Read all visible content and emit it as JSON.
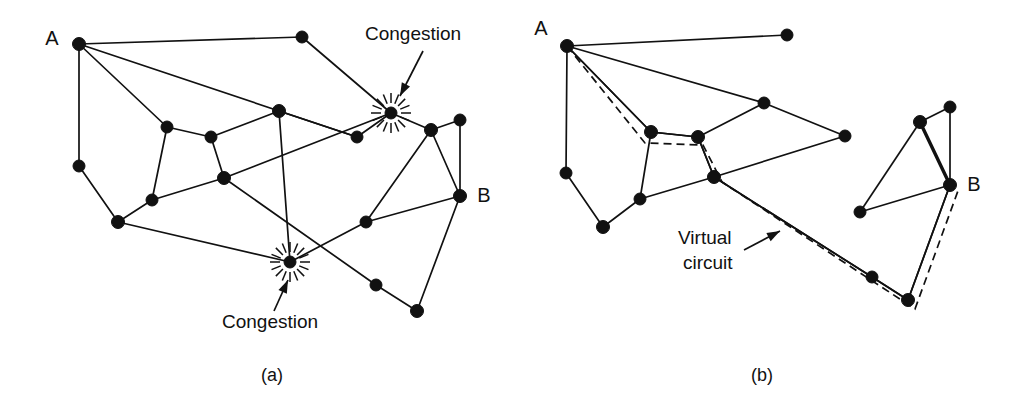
{
  "figure": {
    "background": "#ffffff",
    "ink": "#111111",
    "width": 1019,
    "height": 413
  },
  "panels": [
    {
      "id": "panel-a",
      "caption": "(a)",
      "caption_pos": {
        "x": 272,
        "y": 376
      },
      "nodes": [
        {
          "id": "a_A",
          "x": 79,
          "y": 44,
          "r": 6.5
        },
        {
          "id": "a_n1",
          "x": 302,
          "y": 37,
          "r": 6.0
        },
        {
          "id": "a_n2",
          "x": 167,
          "y": 127,
          "r": 6.0
        },
        {
          "id": "a_n3",
          "x": 211,
          "y": 137,
          "r": 6.0
        },
        {
          "id": "a_n4",
          "x": 279,
          "y": 111,
          "r": 6.5
        },
        {
          "id": "a_n5",
          "x": 357,
          "y": 137,
          "r": 6.0
        },
        {
          "id": "a_n6",
          "x": 431,
          "y": 130,
          "r": 6.5
        },
        {
          "id": "a_n7",
          "x": 460,
          "y": 120,
          "r": 6.0
        },
        {
          "id": "a_B",
          "x": 460,
          "y": 196,
          "r": 6.5
        },
        {
          "id": "a_n8",
          "x": 224,
          "y": 178,
          "r": 6.5
        },
        {
          "id": "a_n9",
          "x": 152,
          "y": 200,
          "r": 6.0
        },
        {
          "id": "a_n10",
          "x": 79,
          "y": 166,
          "r": 6.0
        },
        {
          "id": "a_n11",
          "x": 118,
          "y": 222,
          "r": 6.5
        },
        {
          "id": "a_n12",
          "x": 366,
          "y": 222,
          "r": 6.0
        },
        {
          "id": "a_n13",
          "x": 376,
          "y": 285,
          "r": 6.0
        },
        {
          "id": "a_n14",
          "x": 417,
          "y": 311,
          "r": 6.5
        }
      ],
      "congestion_nodes": [
        {
          "id": "a_c1",
          "x": 391,
          "y": 113,
          "r": 6.0,
          "burst_inner": 10,
          "burst_outer": 20,
          "rays": 16
        },
        {
          "id": "a_c2",
          "x": 290,
          "y": 262,
          "r": 6.0,
          "burst_inner": 10,
          "burst_outer": 20,
          "rays": 16
        }
      ],
      "edges": [
        [
          "a_A",
          "a_n1"
        ],
        [
          "a_A",
          "a_n10"
        ],
        [
          "a_A",
          "a_n2"
        ],
        [
          "a_A",
          "a_n5"
        ],
        [
          "a_n1",
          "a_c1"
        ],
        [
          "a_n2",
          "a_n3"
        ],
        [
          "a_n2",
          "a_n9"
        ],
        [
          "a_n3",
          "a_n4"
        ],
        [
          "a_n3",
          "a_n8"
        ],
        [
          "a_n4",
          "a_n5"
        ],
        [
          "a_n4",
          "a_c2"
        ],
        [
          "a_n5",
          "a_c1"
        ],
        [
          "a_c1",
          "a_n6"
        ],
        [
          "a_n6",
          "a_n7"
        ],
        [
          "a_n6",
          "a_B"
        ],
        [
          "a_n6",
          "a_n12"
        ],
        [
          "a_n7",
          "a_B"
        ],
        [
          "a_B",
          "a_n12"
        ],
        [
          "a_B",
          "a_n14"
        ],
        [
          "a_n8",
          "a_n9"
        ],
        [
          "a_n8",
          "a_n13"
        ],
        [
          "a_n8",
          "a_c1"
        ],
        [
          "a_n9",
          "a_n11"
        ],
        [
          "a_n10",
          "a_n11"
        ],
        [
          "a_n11",
          "a_c2"
        ],
        [
          "a_n12",
          "a_c2"
        ],
        [
          "a_n13",
          "a_n14"
        ]
      ],
      "node_labels": [
        {
          "text": "A",
          "x": 52,
          "y": 40,
          "anchor": "middle"
        },
        {
          "text": "B",
          "x": 484,
          "y": 197,
          "anchor": "middle"
        }
      ],
      "annotations": [
        {
          "id": "congestion-top",
          "text": "Congestion",
          "text_x": 365,
          "text_y": 35,
          "anchor": "start",
          "leader": {
            "x1": 423,
            "y1": 51,
            "x2": 400,
            "y2": 96
          }
        },
        {
          "id": "congestion-bottom",
          "text": "Congestion",
          "text_x": 222,
          "text_y": 323,
          "anchor": "start",
          "leader": {
            "x1": 274,
            "y1": 311,
            "x2": 288,
            "y2": 280
          }
        }
      ]
    },
    {
      "id": "panel-b",
      "caption": "(b)",
      "caption_pos": {
        "x": 762,
        "y": 376
      },
      "nodes": [
        {
          "id": "b_A",
          "x": 567,
          "y": 46,
          "r": 6.5
        },
        {
          "id": "b_n1",
          "x": 787,
          "y": 35,
          "r": 6.0
        },
        {
          "id": "b_n2",
          "x": 651,
          "y": 132,
          "r": 6.5
        },
        {
          "id": "b_n3",
          "x": 698,
          "y": 137,
          "r": 6.5
        },
        {
          "id": "b_n4",
          "x": 764,
          "y": 103,
          "r": 6.0
        },
        {
          "id": "b_n5",
          "x": 845,
          "y": 136,
          "r": 6.0
        },
        {
          "id": "b_n6",
          "x": 714,
          "y": 177,
          "r": 6.5
        },
        {
          "id": "b_n7",
          "x": 640,
          "y": 199,
          "r": 6.0
        },
        {
          "id": "b_n8",
          "x": 566,
          "y": 173,
          "r": 6.0
        },
        {
          "id": "b_n9",
          "x": 603,
          "y": 227,
          "r": 6.5
        },
        {
          "id": "b_n10",
          "x": 920,
          "y": 122,
          "r": 6.5
        },
        {
          "id": "b_n11",
          "x": 950,
          "y": 107,
          "r": 6.0
        },
        {
          "id": "b_B",
          "x": 950,
          "y": 185,
          "r": 6.5
        },
        {
          "id": "b_n12",
          "x": 860,
          "y": 212,
          "r": 6.0
        },
        {
          "id": "b_n13",
          "x": 872,
          "y": 277,
          "r": 6.0
        },
        {
          "id": "b_n14",
          "x": 908,
          "y": 300,
          "r": 6.5
        }
      ],
      "edges": [
        [
          "b_A",
          "b_n1"
        ],
        [
          "b_A",
          "b_n8"
        ],
        [
          "b_A",
          "b_n2"
        ],
        [
          "b_A",
          "b_n4"
        ],
        [
          "b_n2",
          "b_n3"
        ],
        [
          "b_n2",
          "b_n7"
        ],
        [
          "b_n3",
          "b_n4"
        ],
        [
          "b_n3",
          "b_n6"
        ],
        [
          "b_n4",
          "b_n5"
        ],
        [
          "b_n5",
          "b_n6"
        ],
        [
          "b_n6",
          "b_n7"
        ],
        [
          "b_n7",
          "b_n9"
        ],
        [
          "b_n8",
          "b_n9"
        ],
        [
          "b_n10",
          "b_n11"
        ],
        [
          "b_n10",
          "b_n12"
        ],
        [
          "b_n11",
          "b_B"
        ],
        [
          "b_n12",
          "b_B"
        ],
        [
          "b_n13",
          "b_n14"
        ],
        [
          "b_n14",
          "b_B"
        ],
        [
          "b_n6",
          "b_n13"
        ]
      ],
      "thick_edges": [
        [
          "b_n10",
          "b_B"
        ]
      ],
      "virtual_circuit": {
        "label_lines": [
          "Virtual",
          "circuit"
        ],
        "label_x": 678,
        "label_y1": 239,
        "label_y2": 264,
        "leader": {
          "x1": 744,
          "y1": 250,
          "x2": 780,
          "y2": 231
        },
        "solid_path": "M 567,46 L 651,132 L 698,137 L 714,177 L 872,277 L 908,300 L 950,185",
        "dashed_path": "M 567,46 L 645,143 L 703,145 L 722,182 L 880,286 L 915,309 L 959,188"
      },
      "node_labels": [
        {
          "text": "A",
          "x": 541,
          "y": 30,
          "anchor": "middle"
        },
        {
          "text": "B",
          "x": 974,
          "y": 186,
          "anchor": "middle"
        }
      ]
    }
  ]
}
